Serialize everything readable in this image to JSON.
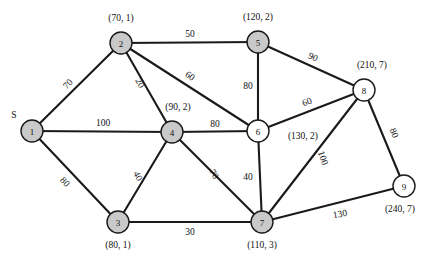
{
  "figure": {
    "width": 432,
    "height": 263,
    "background_color": "#ffffff",
    "edge_color": "#1a1a1a",
    "node_fill_shaded": "#c9c9c9",
    "node_fill_unshaded": "#ffffff",
    "source_marker": "S"
  },
  "chart_data": {
    "type": "diagram",
    "diagram_type": "weighted-undirected-graph",
    "title": "",
    "nodes": [
      {
        "id": "1",
        "label": "1",
        "annotation": "",
        "shaded": true,
        "x": 32,
        "y": 131,
        "r": 11,
        "annot_x": 0,
        "annot_y": 0,
        "is_source": true,
        "source_label": "S",
        "source_x": 14,
        "source_y": 118
      },
      {
        "id": "2",
        "label": "2",
        "annotation": "(70, 1)",
        "shaded": true,
        "x": 121,
        "y": 43,
        "r": 11,
        "annot_x": 121,
        "annot_y": 21,
        "is_source": false,
        "source_label": "",
        "source_x": 0,
        "source_y": 0
      },
      {
        "id": "3",
        "label": "3",
        "annotation": "(80, 1)",
        "shaded": true,
        "x": 118,
        "y": 222,
        "r": 11,
        "annot_x": 118,
        "annot_y": 248,
        "is_source": false,
        "source_label": "",
        "source_x": 0,
        "source_y": 0
      },
      {
        "id": "4",
        "label": "4",
        "annotation": "(90, 2)",
        "shaded": true,
        "x": 172,
        "y": 132,
        "r": 11,
        "annot_x": 178,
        "annot_y": 110,
        "is_source": false,
        "source_label": "",
        "source_x": 0,
        "source_y": 0
      },
      {
        "id": "5",
        "label": "5",
        "annotation": "(120, 2)",
        "shaded": true,
        "x": 258,
        "y": 42,
        "r": 11,
        "annot_x": 258,
        "annot_y": 20,
        "is_source": false,
        "source_label": "",
        "source_x": 0,
        "source_y": 0
      },
      {
        "id": "6",
        "label": "6",
        "annotation": "(130, 2)",
        "shaded": false,
        "x": 258,
        "y": 131,
        "r": 11,
        "annot_x": 303,
        "annot_y": 139,
        "is_source": false,
        "source_label": "",
        "source_x": 0,
        "source_y": 0
      },
      {
        "id": "7",
        "label": "7",
        "annotation": "(110, 3)",
        "shaded": true,
        "x": 262,
        "y": 222,
        "r": 11,
        "annot_x": 262,
        "annot_y": 248,
        "is_source": false,
        "source_label": "",
        "source_x": 0,
        "source_y": 0
      },
      {
        "id": "8",
        "label": "8",
        "annotation": "(210, 7)",
        "shaded": false,
        "x": 364,
        "y": 90,
        "r": 11,
        "annot_x": 372,
        "annot_y": 68,
        "is_source": false,
        "source_label": "",
        "source_x": 0,
        "source_y": 0
      },
      {
        "id": "9",
        "label": "9",
        "annotation": "(240, 7)",
        "shaded": false,
        "x": 404,
        "y": 186,
        "r": 11,
        "annot_x": 400,
        "annot_y": 212,
        "is_source": false,
        "source_label": "",
        "source_x": 0,
        "source_y": 0
      }
    ],
    "edges": [
      {
        "from": "1",
        "to": "2",
        "weight": 70,
        "label_x": 68,
        "label_y": 84,
        "rotate": -45
      },
      {
        "from": "1",
        "to": "4",
        "weight": 100,
        "label_x": 103,
        "label_y": 123,
        "rotate": 0
      },
      {
        "from": "1",
        "to": "3",
        "weight": 80,
        "label_x": 65,
        "label_y": 182,
        "rotate": 47
      },
      {
        "from": "2",
        "to": "5",
        "weight": 50,
        "label_x": 190,
        "label_y": 34,
        "rotate": 0
      },
      {
        "from": "2",
        "to": "4",
        "weight": 20,
        "label_x": 140,
        "label_y": 83,
        "rotate": 62
      },
      {
        "from": "2",
        "to": "6",
        "weight": 60,
        "label_x": 190,
        "label_y": 76,
        "rotate": 34
      },
      {
        "from": "3",
        "to": "4",
        "weight": 40,
        "label_x": 138,
        "label_y": 176,
        "rotate": 62
      },
      {
        "from": "3",
        "to": "7",
        "weight": 30,
        "label_x": 190,
        "label_y": 232,
        "rotate": 0
      },
      {
        "from": "4",
        "to": "6",
        "weight": 80,
        "label_x": 215,
        "label_y": 124,
        "rotate": 0
      },
      {
        "from": "4",
        "to": "7",
        "weight": 70,
        "label_x": 214,
        "label_y": 174,
        "rotate": 57
      },
      {
        "from": "5",
        "to": "6",
        "weight": 80,
        "label_x": 248,
        "label_y": 86,
        "rotate": 0
      },
      {
        "from": "5",
        "to": "8",
        "weight": 90,
        "label_x": 313,
        "label_y": 57,
        "rotate": 25
      },
      {
        "from": "6",
        "to": "7",
        "weight": 40,
        "label_x": 248,
        "label_y": 177,
        "rotate": 0
      },
      {
        "from": "6",
        "to": "8",
        "weight": 60,
        "label_x": 307,
        "label_y": 102,
        "rotate": -23
      },
      {
        "from": "7",
        "to": "8",
        "weight": 100,
        "label_x": 323,
        "label_y": 158,
        "rotate": 71
      },
      {
        "from": "7",
        "to": "9",
        "weight": 130,
        "label_x": 340,
        "label_y": 214,
        "rotate": -11
      },
      {
        "from": "8",
        "to": "9",
        "weight": 80,
        "label_x": 394,
        "label_y": 133,
        "rotate": 67
      }
    ]
  }
}
